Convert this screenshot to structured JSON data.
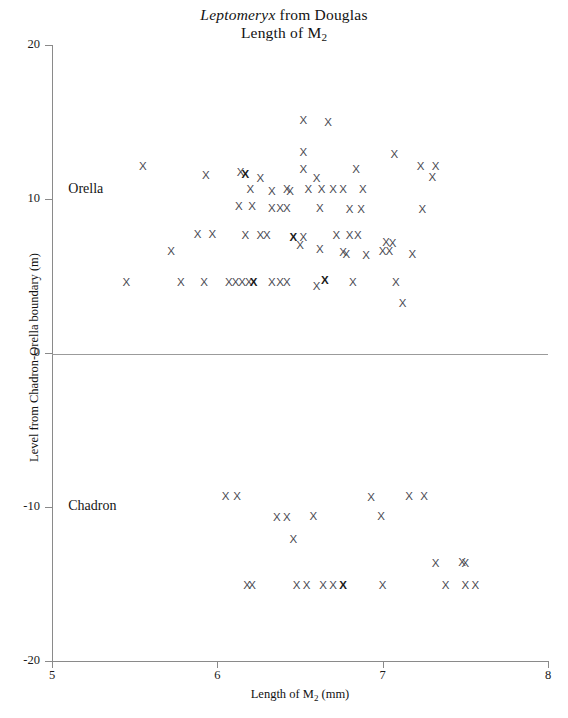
{
  "figure": {
    "title_line1_genus": "Leptomeryx",
    "title_line1_rest": " from Douglas",
    "title_line2_prefix": "Length of M",
    "title_line2_sub": "2",
    "point_marker": "X"
  },
  "axes": {
    "y_title": "Level from Chadron-Orella boundary (m)",
    "x_title_prefix": "Length of M",
    "x_title_sub": "2",
    "x_title_suffix": " (mm)",
    "y_ticks": [
      {
        "label": "20",
        "value": 20
      },
      {
        "label": "10",
        "value": 10
      },
      {
        "label": "0",
        "value": 0
      },
      {
        "label": "-10",
        "value": -10
      },
      {
        "label": "-20",
        "value": -20
      }
    ],
    "x_ticks": [
      {
        "label": "5",
        "value": 5
      },
      {
        "label": "6",
        "value": 6
      },
      {
        "label": "7",
        "value": 7
      },
      {
        "label": "8",
        "value": 8
      }
    ],
    "zero_reference_line": true
  },
  "annotations": {
    "orella": "Orella",
    "chadron": "Chadron"
  },
  "chart_data": {
    "type": "scatter",
    "xlabel": "Length of M2 (mm)",
    "ylabel": "Level from Chadron-Orella boundary (m)",
    "xlim": [
      5,
      8
    ],
    "ylim": [
      -20,
      20
    ],
    "grid": false,
    "legend": null,
    "marker": "X",
    "reference_lines": [
      {
        "axis": "y",
        "value": 0
      }
    ],
    "groups": [
      {
        "name": "Orella",
        "label_position": {
          "x": 5.05,
          "y": 10.6
        },
        "points": [
          {
            "x": 6.52,
            "y": 15.1
          },
          {
            "x": 6.67,
            "y": 15.0
          },
          {
            "x": 6.52,
            "y": 13.0
          },
          {
            "x": 7.07,
            "y": 12.9
          },
          {
            "x": 5.55,
            "y": 12.1
          },
          {
            "x": 6.52,
            "y": 11.9
          },
          {
            "x": 7.23,
            "y": 12.1
          },
          {
            "x": 7.32,
            "y": 12.1
          },
          {
            "x": 5.93,
            "y": 11.5
          },
          {
            "x": 6.14,
            "y": 11.7
          },
          {
            "x": 6.17,
            "y": 11.6
          },
          {
            "x": 6.26,
            "y": 11.3
          },
          {
            "x": 6.6,
            "y": 11.3
          },
          {
            "x": 6.84,
            "y": 11.9
          },
          {
            "x": 7.3,
            "y": 11.4
          },
          {
            "x": 6.2,
            "y": 10.6
          },
          {
            "x": 6.42,
            "y": 10.6
          },
          {
            "x": 6.44,
            "y": 10.5
          },
          {
            "x": 6.55,
            "y": 10.6
          },
          {
            "x": 6.63,
            "y": 10.6
          },
          {
            "x": 6.7,
            "y": 10.6
          },
          {
            "x": 6.76,
            "y": 10.6
          },
          {
            "x": 6.88,
            "y": 10.6
          },
          {
            "x": 6.33,
            "y": 10.5
          },
          {
            "x": 6.13,
            "y": 9.5
          },
          {
            "x": 6.21,
            "y": 9.5
          },
          {
            "x": 6.33,
            "y": 9.4
          },
          {
            "x": 6.38,
            "y": 9.4
          },
          {
            "x": 6.42,
            "y": 9.4
          },
          {
            "x": 6.62,
            "y": 9.4
          },
          {
            "x": 6.8,
            "y": 9.3
          },
          {
            "x": 6.87,
            "y": 9.3
          },
          {
            "x": 7.24,
            "y": 9.3
          },
          {
            "x": 5.88,
            "y": 7.7
          },
          {
            "x": 5.97,
            "y": 7.7
          },
          {
            "x": 6.17,
            "y": 7.6
          },
          {
            "x": 6.26,
            "y": 7.6
          },
          {
            "x": 6.3,
            "y": 7.6
          },
          {
            "x": 6.46,
            "y": 7.5
          },
          {
            "x": 6.52,
            "y": 7.5
          },
          {
            "x": 6.72,
            "y": 7.6
          },
          {
            "x": 6.8,
            "y": 7.6
          },
          {
            "x": 6.85,
            "y": 7.6
          },
          {
            "x": 6.5,
            "y": 7.0
          },
          {
            "x": 7.02,
            "y": 7.2
          },
          {
            "x": 7.06,
            "y": 7.1
          },
          {
            "x": 5.72,
            "y": 6.6
          },
          {
            "x": 6.62,
            "y": 6.7
          },
          {
            "x": 6.76,
            "y": 6.5
          },
          {
            "x": 6.78,
            "y": 6.4
          },
          {
            "x": 6.9,
            "y": 6.3
          },
          {
            "x": 7.0,
            "y": 6.6
          },
          {
            "x": 7.04,
            "y": 6.6
          },
          {
            "x": 7.18,
            "y": 6.4
          },
          {
            "x": 5.45,
            "y": 4.6
          },
          {
            "x": 5.78,
            "y": 4.6
          },
          {
            "x": 5.92,
            "y": 4.6
          },
          {
            "x": 6.07,
            "y": 4.6
          },
          {
            "x": 6.11,
            "y": 4.6
          },
          {
            "x": 6.15,
            "y": 4.6
          },
          {
            "x": 6.19,
            "y": 4.6
          },
          {
            "x": 6.22,
            "y": 4.6
          },
          {
            "x": 6.33,
            "y": 4.6
          },
          {
            "x": 6.38,
            "y": 4.6
          },
          {
            "x": 6.42,
            "y": 4.6
          },
          {
            "x": 6.6,
            "y": 4.3
          },
          {
            "x": 6.65,
            "y": 4.7
          },
          {
            "x": 6.82,
            "y": 4.6
          },
          {
            "x": 7.08,
            "y": 4.6
          },
          {
            "x": 7.12,
            "y": 3.2
          }
        ]
      },
      {
        "name": "Chadron",
        "label_position": {
          "x": 5.05,
          "y": -10.0
        },
        "points": [
          {
            "x": 6.05,
            "y": -9.3
          },
          {
            "x": 6.12,
            "y": -9.3
          },
          {
            "x": 6.93,
            "y": -9.4
          },
          {
            "x": 7.16,
            "y": -9.3
          },
          {
            "x": 7.25,
            "y": -9.3
          },
          {
            "x": 6.36,
            "y": -10.7
          },
          {
            "x": 6.42,
            "y": -10.7
          },
          {
            "x": 6.58,
            "y": -10.6
          },
          {
            "x": 6.99,
            "y": -10.6
          },
          {
            "x": 6.46,
            "y": -12.1
          },
          {
            "x": 7.32,
            "y": -13.7
          },
          {
            "x": 7.48,
            "y": -13.6
          },
          {
            "x": 7.5,
            "y": -13.7
          },
          {
            "x": 6.18,
            "y": -15.1
          },
          {
            "x": 6.21,
            "y": -15.1
          },
          {
            "x": 6.48,
            "y": -15.1
          },
          {
            "x": 6.54,
            "y": -15.1
          },
          {
            "x": 6.64,
            "y": -15.1
          },
          {
            "x": 6.7,
            "y": -15.1
          },
          {
            "x": 6.76,
            "y": -15.1
          },
          {
            "x": 7.0,
            "y": -15.1
          },
          {
            "x": 7.38,
            "y": -15.1
          },
          {
            "x": 7.5,
            "y": -15.1
          },
          {
            "x": 7.56,
            "y": -15.1
          }
        ]
      }
    ]
  },
  "bold_points": [
    {
      "x": 6.17,
      "y": 11.6
    },
    {
      "x": 6.46,
      "y": 7.5
    },
    {
      "x": 6.22,
      "y": 4.6
    },
    {
      "x": 6.65,
      "y": 4.7
    },
    {
      "x": 6.76,
      "y": -15.1
    }
  ]
}
